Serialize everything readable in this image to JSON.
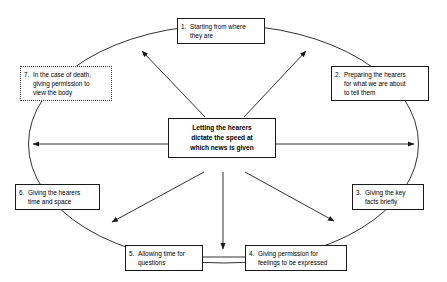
{
  "diagram": {
    "title": "Letting the hearers dictate the speed at which news is given",
    "center": {
      "lines": [
        "Letting the hearers",
        "dictate the speed at",
        "which news is given"
      ]
    },
    "ring": {
      "shape": "ellipse",
      "stroke": "#1a1a1a"
    },
    "nodes": [
      {
        "number": "1.",
        "lines": [
          "Starting from where",
          "they are"
        ],
        "border": "solid"
      },
      {
        "number": "2.",
        "lines": [
          "Preparing the hearers",
          "for what we are about",
          "to tell them"
        ],
        "border": "solid"
      },
      {
        "number": "3.",
        "lines": [
          "Giving the key",
          "facts briefly"
        ],
        "border": "solid"
      },
      {
        "number": "4.",
        "lines": [
          "Giving permission for",
          "feelings to be expressed"
        ],
        "border": "solid"
      },
      {
        "number": "5.",
        "lines": [
          "Allowing time for",
          "questions"
        ],
        "border": "solid"
      },
      {
        "number": "6.",
        "lines": [
          "Giving the hearers",
          "time and space"
        ],
        "border": "solid"
      },
      {
        "number": "7.",
        "lines": [
          "In the case of death,",
          "giving permission to",
          "view the body"
        ],
        "border": "dotted"
      }
    ]
  }
}
